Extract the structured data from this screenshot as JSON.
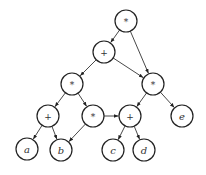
{
  "diagram": {
    "type": "expression-dag",
    "nodes": [
      {
        "id": "n1",
        "label": "*",
        "kind": "op"
      },
      {
        "id": "n2",
        "label": "+",
        "kind": "op"
      },
      {
        "id": "n3",
        "label": "*",
        "kind": "op"
      },
      {
        "id": "n4",
        "label": "*",
        "kind": "op"
      },
      {
        "id": "n5",
        "label": "+",
        "kind": "op"
      },
      {
        "id": "n6",
        "label": "*",
        "kind": "op"
      },
      {
        "id": "n7",
        "label": "+",
        "kind": "op"
      },
      {
        "id": "n8",
        "label": "e",
        "kind": "leaf"
      },
      {
        "id": "n9",
        "label": "a",
        "kind": "leaf"
      },
      {
        "id": "n10",
        "label": "b",
        "kind": "leaf"
      },
      {
        "id": "n11",
        "label": "c",
        "kind": "leaf"
      },
      {
        "id": "n12",
        "label": "d",
        "kind": "leaf"
      }
    ],
    "edges": [
      {
        "from": "n1",
        "to": "n2"
      },
      {
        "from": "n1",
        "to": "n4"
      },
      {
        "from": "n2",
        "to": "n3"
      },
      {
        "from": "n2",
        "to": "n4"
      },
      {
        "from": "n3",
        "to": "n5"
      },
      {
        "from": "n3",
        "to": "n6"
      },
      {
        "from": "n4",
        "to": "n7"
      },
      {
        "from": "n4",
        "to": "n8"
      },
      {
        "from": "n5",
        "to": "n9"
      },
      {
        "from": "n5",
        "to": "n10"
      },
      {
        "from": "n6",
        "to": "n10"
      },
      {
        "from": "n6",
        "to": "n7"
      },
      {
        "from": "n7",
        "to": "n11"
      },
      {
        "from": "n7",
        "to": "n12"
      }
    ]
  }
}
